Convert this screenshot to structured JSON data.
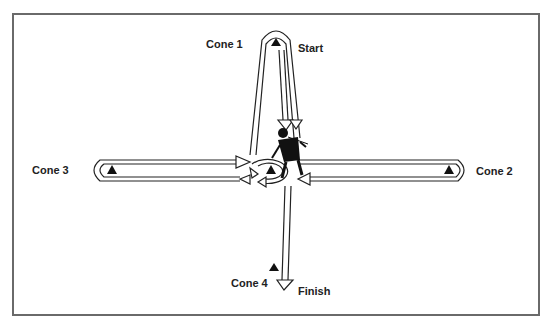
{
  "diagram": {
    "type": "agility-drill-course",
    "labels": {
      "cone1": "Cone 1",
      "cone2": "Cone 2",
      "cone3": "Cone 3",
      "cone4": "Cone 4",
      "start": "Start",
      "finish": "Finish"
    },
    "nodes": [
      {
        "id": "cone1",
        "label": "Cone 1",
        "x": 276,
        "y": 44
      },
      {
        "id": "cone2",
        "label": "Cone 2",
        "x": 449,
        "y": 170
      },
      {
        "id": "cone3",
        "label": "Cone 3",
        "x": 112,
        "y": 170
      },
      {
        "id": "center",
        "label": "",
        "x": 271,
        "y": 170
      },
      {
        "id": "cone4",
        "label": "Cone 4",
        "x": 274,
        "y": 268
      }
    ],
    "path_sequence": [
      "Start",
      "Cone 1",
      "Center",
      "Cone 2",
      "Center",
      "Cone 3",
      "Center",
      "Cone 4",
      "Finish"
    ],
    "colors": {
      "line": "#222222",
      "frame": "#6a6a6a",
      "fill": "#ffffff"
    }
  }
}
